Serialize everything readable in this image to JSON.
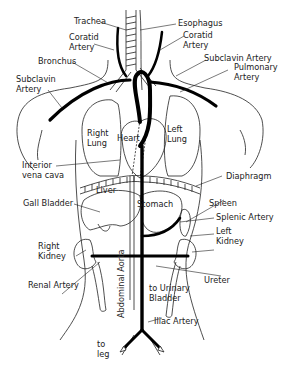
{
  "diagram": {
    "labels": {
      "trachea": "Trachea",
      "esophagus": "Esophagus",
      "coratid_left": "Coratid\nArtery",
      "coratid_right": "Coratid\nArtery",
      "bronchus": "Bronchus",
      "subclavin_left": "Subclavin\nArtery",
      "subclavin_right": "Subclavin Artery",
      "pulmonary": "Pulmonary\nArtery",
      "right_lung": "Right\nLung",
      "left_lung": "Left\nLung",
      "heart": "Heart",
      "interior_vena_cava": "Interior\nvena cava",
      "diaphragm": "Diaphragm",
      "liver": "Liver",
      "stomach": "Stomach",
      "gall_bladder": "Gall Bladder",
      "spleen": "Spleen",
      "splenic_artery": "Splenic Artery",
      "left_kidney": "Left\nKidney",
      "right_kidney": "Right\nKidney",
      "renal_artery": "Renal Artery",
      "abdominal_aorta": "Abdominal Aorta",
      "ureter": "Ureter",
      "to_urinary_bladder": "to Urinary\nBladder",
      "iliac_artery": "Iliac Artery",
      "to_leg": "to\nleg"
    },
    "colors": {
      "line": "#222222",
      "artery": "#000000",
      "background": "#ffffff"
    }
  }
}
